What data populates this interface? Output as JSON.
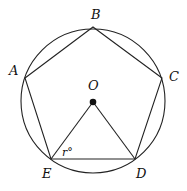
{
  "diagram": {
    "type": "geometry",
    "labels": {
      "A": "A",
      "B": "B",
      "C": "C",
      "D": "D",
      "E": "E",
      "O": "O",
      "angle": "r°"
    },
    "colors": {
      "stroke": "#222222",
      "background": "#ffffff"
    }
  }
}
